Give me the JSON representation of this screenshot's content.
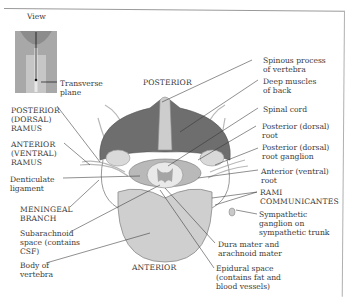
{
  "diagram": {
    "type": "anatomical cross-section",
    "inset": {
      "view_label": "View",
      "plane_label": "Transverse\nplane"
    },
    "orientation": {
      "top": "POSTERIOR",
      "bottom": "ANTERIOR"
    },
    "left_labels": [
      {
        "id": "posterior-ramus",
        "text": "POSTERIOR\n(DORSAL)\nRAMUS"
      },
      {
        "id": "anterior-ramus",
        "text": "ANTERIOR\n(VENTRAL)\nRAMUS"
      },
      {
        "id": "denticulate-ligament",
        "text": "Denticulate\nligament"
      },
      {
        "id": "meningeal-branch",
        "text": "MENINGEAL\nBRANCH"
      },
      {
        "id": "subarachnoid-space",
        "text": "Subarachnoid\nspace (contains\nCSF)"
      },
      {
        "id": "body-of-vertebra",
        "text": "Body of\nvertebra"
      }
    ],
    "right_labels": [
      {
        "id": "spinous-process",
        "text": "Spinous process\nof vertebra"
      },
      {
        "id": "deep-muscles",
        "text": "Deep muscles\nof back"
      },
      {
        "id": "spinal-cord",
        "text": "Spinal cord"
      },
      {
        "id": "posterior-root",
        "text": "Posterior (dorsal)\nroot"
      },
      {
        "id": "posterior-root-ganglion",
        "text": "Posterior (dorsal)\nroot ganglion"
      },
      {
        "id": "anterior-root",
        "text": "Anterior (ventral)\nroot"
      },
      {
        "id": "rami-communicantes",
        "text": "RAMI\nCOMMUNICANTES"
      },
      {
        "id": "sympathetic-ganglion",
        "text": "Sympathetic\nganglion on\nsympathetic trunk"
      }
    ],
    "bottom_labels": [
      {
        "id": "dura-arachnoid",
        "text": "Dura mater and\narachnoid mater"
      },
      {
        "id": "epidural-space",
        "text": "Epidural space\n(contains fat and\nblood vessels)"
      }
    ],
    "colors": {
      "muscle": "#6e6e6e",
      "bone": "#d4d4d4",
      "cord": "#e6e6e6",
      "nerve": "#bdbdbd",
      "leader": "#333333"
    }
  }
}
